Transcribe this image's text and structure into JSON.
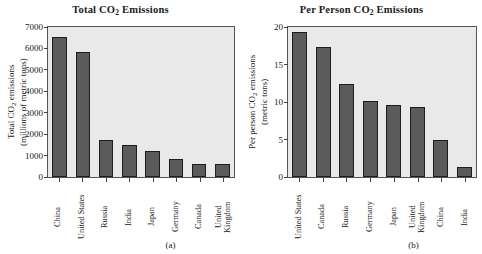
{
  "figure": {
    "panels": [
      {
        "caption": "(a)",
        "title_prefix": "Total CO",
        "title_sub": "2",
        "title_suffix": " Emissions",
        "ylabel_line1": "Total CO",
        "ylabel_sub": "2",
        "ylabel_line1b": " emissions",
        "ylabel_line2": "(millions of metric tons)",
        "yticks": [
          "0",
          "1000",
          "2000",
          "3000",
          "4000",
          "5000",
          "6000",
          "7000"
        ]
      },
      {
        "caption": "(b)",
        "title_prefix": "Per Person CO",
        "title_sub": "2",
        "title_suffix": " Emissions",
        "ylabel_line1": "Per person CO",
        "ylabel_sub": "2",
        "ylabel_line1b": " emissions",
        "ylabel_line2": "(metric tons)",
        "yticks": [
          "0",
          "5",
          "10",
          "15",
          "20"
        ]
      }
    ]
  },
  "chart_data": [
    {
      "type": "bar",
      "title": "Total CO2 Emissions",
      "xlabel": "",
      "ylabel": "Total CO2 emissions (millions of metric tons)",
      "ylim": [
        0,
        7000
      ],
      "ytick_step": 1000,
      "grid": false,
      "legend": null,
      "bar_color": "#5b5b5b",
      "plot_background": "#e9e9e9",
      "categories": [
        "China",
        "United States",
        "Russia",
        "India",
        "Japan",
        "Germany",
        "Canada",
        "United Kingdom"
      ],
      "values": [
        6550,
        5840,
        1750,
        1500,
        1230,
        850,
        590,
        590
      ],
      "caption": "(a)"
    },
    {
      "type": "bar",
      "title": "Per Person CO2 Emissions",
      "xlabel": "",
      "ylabel": "Per person CO2 emissions (metric tons)",
      "ylim": [
        0,
        20
      ],
      "ytick_step": 5,
      "grid": false,
      "legend": null,
      "bar_color": "#5b5b5b",
      "plot_background": "#e9e9e9",
      "categories": [
        "United States",
        "Canada",
        "Russia",
        "Germany",
        "Japan",
        "United Kingdom",
        "China",
        "India"
      ],
      "values": [
        19.3,
        17.4,
        12.4,
        10.1,
        9.6,
        9.4,
        5.0,
        1.4
      ],
      "caption": "(b)"
    }
  ]
}
